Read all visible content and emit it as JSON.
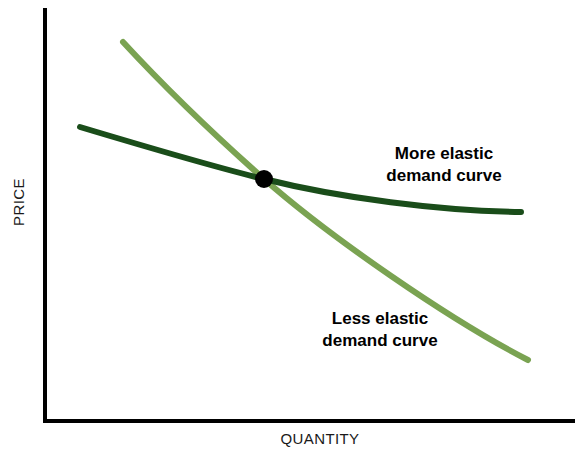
{
  "figure": {
    "background_color": "#ffffff",
    "axis_color": "#000000"
  },
  "axes": {
    "y_label": "PRICE",
    "x_label": "QUANTITY"
  },
  "annotations": {
    "more_elastic": {
      "line1": "More elastic",
      "line2": "demand curve"
    },
    "less_elastic": {
      "line1": "Less elastic",
      "line2": "demand curve"
    }
  },
  "chart_data": {
    "type": "line",
    "title": "",
    "xlabel": "QUANTITY",
    "ylabel": "PRICE",
    "xlim": [
      0,
      100
    ],
    "ylim": [
      0,
      100
    ],
    "grid": false,
    "legend": "inline-annotations",
    "axis_ticks": {
      "x": [],
      "y": []
    },
    "series": [
      {
        "name": "More elastic demand curve",
        "color": "#1a4d1a",
        "line_width": 5,
        "shape": "convex-to-origin",
        "label_line1": "More elastic",
        "label_line2": "demand curve",
        "x": [
          7,
          20,
          33,
          41,
          55,
          70,
          85,
          90
        ],
        "y": [
          71,
          65,
          60,
          56,
          51,
          48,
          47,
          47
        ]
      },
      {
        "name": "Less elastic demand curve",
        "color": "#7aa352",
        "line_width": 5,
        "shape": "steep-near-linear",
        "label_line1": "Less elastic",
        "label_line2": "demand curve",
        "x": [
          15,
          25,
          34,
          41,
          55,
          70,
          85,
          91
        ],
        "y": [
          92,
          81,
          70,
          56,
          40,
          25,
          13,
          9
        ]
      }
    ],
    "markers": [
      {
        "name": "intersection-point",
        "x": 41,
        "y": 56,
        "color": "#000000",
        "radius": 9
      }
    ]
  }
}
